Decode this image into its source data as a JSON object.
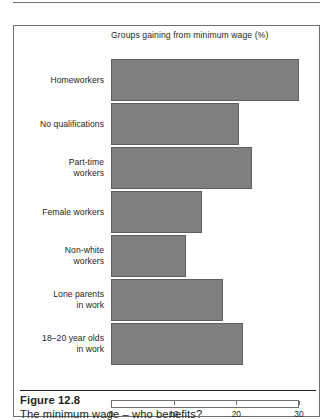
{
  "figure": {
    "caption_title": "Figure 12.8",
    "caption_text": "The minimum wage – who benefits?"
  },
  "chart_data": {
    "type": "bar",
    "orientation": "horizontal",
    "title": "Groups gaining from minimum wage (%)",
    "xlabel": "",
    "ylabel": "",
    "xlim": [
      0,
      30
    ],
    "xticks": [
      0,
      10,
      20,
      30
    ],
    "xtick_labels": [
      "0",
      "10",
      "20",
      "30"
    ],
    "grid": false,
    "legend": false,
    "bar_color": "#808080",
    "categories": [
      "Homeworkers",
      "No qualifications",
      "Part-time workers",
      "Female workers",
      "Non-white workers",
      "Lone parents in work",
      "18–20 year olds in work"
    ],
    "category_lines": [
      [
        "Homeworkers"
      ],
      [
        "No qualifications"
      ],
      [
        "Part-time",
        "workers"
      ],
      [
        "Female workers"
      ],
      [
        "Non-white",
        "workers"
      ],
      [
        "Lone parents",
        "in work"
      ],
      [
        "18–20 year olds",
        "in work"
      ]
    ],
    "values": [
      30,
      20.5,
      22.5,
      14.5,
      12,
      17.8,
      21
    ]
  }
}
